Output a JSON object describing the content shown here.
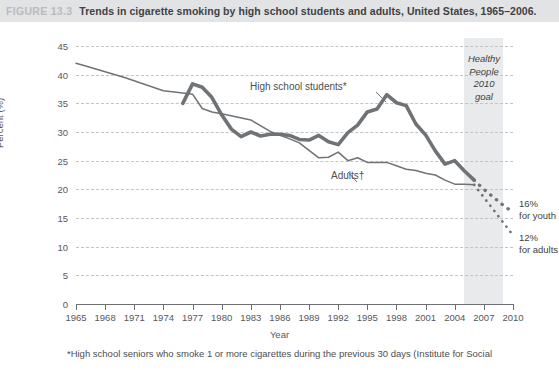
{
  "figure": {
    "number": "FIGURE 13.3",
    "title": "Trends in cigarette smoking by high school students and adults, United States, 1965–2006."
  },
  "annotations": {
    "high_school_label": "High school students*",
    "adults_label": "Adults†",
    "goal_label": "Healthy\nPeople\n2010\ngoal",
    "goal_label_lines": [
      "Healthy",
      "People",
      "2010",
      "goal"
    ],
    "endpoint_youth_line1": "16%",
    "endpoint_youth_line2": "for youth",
    "endpoint_adults_line1": "12%",
    "endpoint_adults_line2": "for adults"
  },
  "footnote": "*High school seniors who smoke 1 or more cigarettes during the previous 30 days (Institute for Social",
  "colors": {
    "title_bar": "#e2e3e4",
    "figure_number": "#b9bbbd",
    "goal_band": "#e9eaeb",
    "high_school_line": "#6f7376",
    "adults_line": "#6f7376",
    "gridline": "#c2c4c6",
    "axis": "#6d6f72"
  },
  "chart_data": {
    "type": "line",
    "title": "Trends in cigarette smoking by high school students and adults, United States, 1965–2006.",
    "xlabel": "Year",
    "ylabel": "Percent (%)",
    "xlim": [
      1965,
      2010
    ],
    "ylim": [
      0,
      45
    ],
    "grid": true,
    "legend": "inline-labels",
    "y_ticks": [
      0,
      5,
      10,
      15,
      20,
      25,
      30,
      35,
      40,
      45
    ],
    "x_ticks": [
      1965,
      1968,
      1971,
      1974,
      1977,
      1980,
      1983,
      1986,
      1989,
      1992,
      1995,
      1998,
      2001,
      2004,
      2007,
      2010
    ],
    "shaded_region": {
      "label": "Healthy People 2010 goal",
      "x_start": 2005,
      "x_end": 2009
    },
    "series": [
      {
        "name": "High school students*",
        "style": "thick-solid-then-dotted",
        "x": [
          1976,
          1977,
          1978,
          1979,
          1980,
          1981,
          1982,
          1983,
          1984,
          1985,
          1986,
          1987,
          1988,
          1989,
          1990,
          1991,
          1992,
          1993,
          1994,
          1995,
          1996,
          1997,
          1998,
          1999,
          2000,
          2001,
          2002,
          2003,
          2004,
          2005,
          2006
        ],
        "values": [
          35.0,
          38.4,
          37.8,
          36.0,
          33.0,
          30.5,
          29.2,
          30.0,
          29.3,
          29.6,
          29.6,
          29.4,
          28.7,
          28.6,
          29.4,
          28.3,
          27.8,
          29.9,
          31.2,
          33.5,
          34.0,
          36.5,
          35.1,
          34.6,
          31.4,
          29.5,
          26.7,
          24.4,
          25.0,
          23.2,
          21.6
        ],
        "projection_x": [
          2006,
          2007,
          2008,
          2009,
          2010
        ],
        "projection_values": [
          21.6,
          20.0,
          18.6,
          17.2,
          16.0
        ],
        "projection_endpoint": 16
      },
      {
        "name": "Adults†",
        "style": "thin-solid-then-dotted",
        "x": [
          1965,
          1966,
          1970,
          1974,
          1976,
          1977,
          1978,
          1979,
          1980,
          1983,
          1985,
          1987,
          1988,
          1990,
          1991,
          1992,
          1993,
          1994,
          1995,
          1997,
          1998,
          1999,
          2000,
          2001,
          2002,
          2003,
          2004,
          2005,
          2006
        ],
        "values": [
          42.0,
          41.5,
          39.5,
          37.2,
          36.8,
          36.6,
          34.1,
          33.5,
          33.2,
          32.1,
          30.1,
          28.8,
          28.1,
          25.5,
          25.6,
          26.5,
          25.0,
          25.5,
          24.7,
          24.7,
          24.1,
          23.5,
          23.3,
          22.8,
          22.5,
          21.6,
          20.9,
          20.9,
          20.8
        ],
        "projection_x": [
          2006,
          2007,
          2008,
          2009,
          2010
        ],
        "projection_values": [
          20.8,
          18.6,
          16.4,
          14.2,
          12.0
        ],
        "projection_endpoint": 12
      }
    ],
    "endpoint_annotations": [
      {
        "text": "16% for youth",
        "value": 16,
        "x": 2010
      },
      {
        "text": "12% for adults",
        "value": 12,
        "x": 2010
      }
    ]
  }
}
